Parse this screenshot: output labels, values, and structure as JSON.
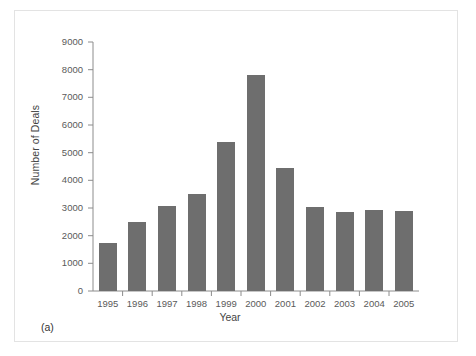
{
  "figure": {
    "caption": "(a)"
  },
  "chart_data": {
    "type": "bar",
    "title": "",
    "xlabel": "Year",
    "ylabel": "Number of Deals",
    "categories": [
      "1995",
      "1996",
      "1997",
      "1998",
      "1999",
      "2000",
      "2001",
      "2002",
      "2003",
      "2004",
      "2005"
    ],
    "values": [
      1750,
      2480,
      3080,
      3520,
      5370,
      7800,
      4450,
      3030,
      2850,
      2920,
      2890
    ],
    "ylim": [
      0,
      9000
    ],
    "yticks": [
      0,
      1000,
      2000,
      3000,
      4000,
      5000,
      6000,
      7000,
      8000,
      9000
    ],
    "ytick_labels": [
      "0",
      "1000",
      "2000",
      "3000",
      "4000",
      "5000",
      "6000",
      "7000",
      "8000",
      "9000"
    ],
    "grid": false,
    "legend": null,
    "bar_color": "#6e6e6e",
    "axis_color": "#8c8c8c"
  }
}
